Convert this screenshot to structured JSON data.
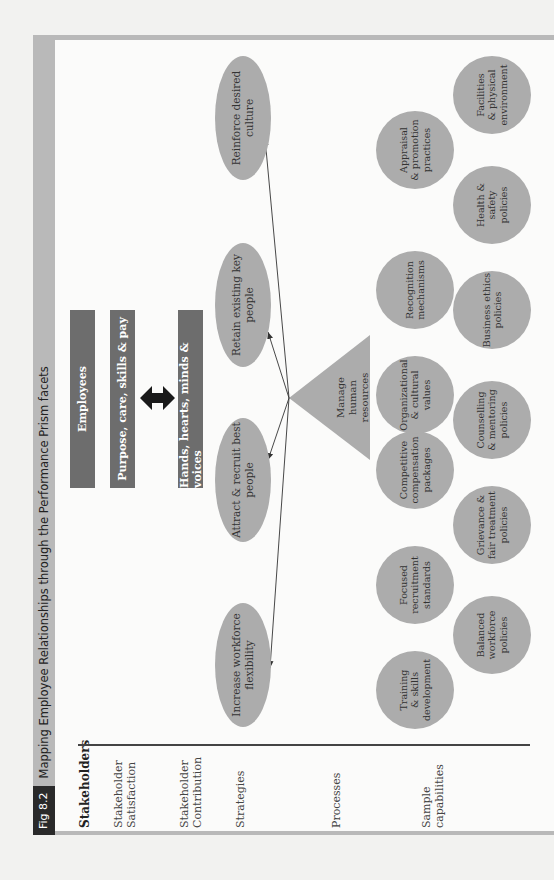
{
  "figure": {
    "tag": "Fig 8.2",
    "title": "Mapping Employee Relationships through the Performance Prism facets"
  },
  "row_labels": {
    "stakeholders": "Stakeholders",
    "satisfaction": "Stakeholder Satisfaction",
    "contribution": "Stakeholder Contribution",
    "strategies": "Strategies",
    "processes": "Processes",
    "capabilities": "Sample capabilities"
  },
  "stakeholder": {
    "name": "Employees",
    "satisfaction": "Purpose, care, skills & pay",
    "contribution": "Hands, hearts, minds & voices",
    "exchange_icon": "double-arrow-icon"
  },
  "strategies": [
    {
      "label": "Increase workforce flexibility"
    },
    {
      "label": "Attract & recruit best people"
    },
    {
      "label": "Retain existing key people"
    },
    {
      "label": "Reinforce desired culture"
    }
  ],
  "process": {
    "label": "Manage\nhuman\nresources"
  },
  "capabilities": {
    "row1": [
      {
        "label": "Training\n& skills\ndevelopment"
      },
      {
        "label": "Focused\nrecruitment\nstandards"
      },
      {
        "label": "Competitive\ncompensation\npackages"
      },
      {
        "label": "Organizational\n& cultural\nvalues"
      },
      {
        "label": "Recognition\nmechanisms"
      },
      {
        "label": "Appraisal\n& promotion\npractices"
      }
    ],
    "row2": [
      {
        "label": "Balanced\nworkforce\npolicies"
      },
      {
        "label": "Grievance &\nfair treatment\npolicies"
      },
      {
        "label": "Counselling\n& mentoring\npolicies"
      },
      {
        "label": "Business ethics\npolicies"
      },
      {
        "label": "Health &\nsafety\npolicies"
      },
      {
        "label": "Facilities\n& physical\nenvironment"
      }
    ]
  },
  "colors": {
    "bar": "#6d6d6d",
    "shape_fill": "#acacac",
    "frame": "#b9b9b9",
    "fig_tag": "#2a2a2a"
  }
}
